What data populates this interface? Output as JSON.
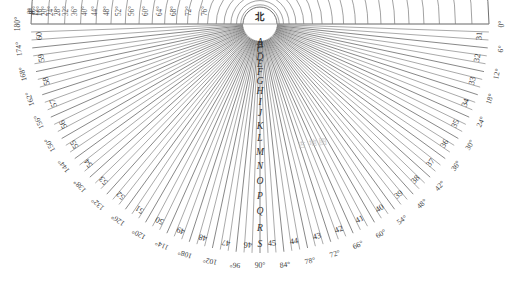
{
  "figure": {
    "kind": "polar-semicircle-star-chart",
    "north_label": "北",
    "watermark": "古 地 图",
    "degree_suffix": "°",
    "background": "#ffffff",
    "line_color": "#555555",
    "text_color": "#3a3a3a"
  },
  "geometry": {
    "center_x": 260,
    "center_y": 24,
    "inner_radius": 17,
    "outer_radius": 229,
    "start_angle_deg": 0,
    "end_angle_deg": 180,
    "radial_step_deg": 2,
    "top_label_step_deg": 4,
    "outer_label_step_deg": 6
  },
  "top_degrees_right": [
    "0°",
    "4°",
    "8°",
    "12°",
    "16°",
    "20°",
    "24°",
    "28°",
    "32°",
    "36°",
    "40°",
    "44°",
    "48°",
    "52°",
    "56°",
    "60°",
    "64°",
    "68°",
    "72°",
    "76°"
  ],
  "top_degrees_left": [
    "0°",
    "6°",
    "12°"
  ],
  "outer_degrees": [
    "0°",
    "6°",
    "12°",
    "18°",
    "24°",
    "30°",
    "36°",
    "42°",
    "48°",
    "54°",
    "60°",
    "66°",
    "72°",
    "78°",
    "84°",
    "90°",
    "96°",
    "102°",
    "108°",
    "114°",
    "120°",
    "126°",
    "132°",
    "138°",
    "144°",
    "150°",
    "156°",
    "162°",
    "168°",
    "174°",
    "180°"
  ],
  "outer_cell_numbers": [
    31,
    32,
    33,
    34,
    35,
    36,
    37,
    38,
    39,
    40,
    41,
    42,
    43,
    44,
    45,
    46,
    47,
    48,
    49,
    50,
    51,
    52,
    53,
    54,
    55,
    56,
    57,
    58,
    59,
    60
  ],
  "center_ring_letters": [
    "S",
    "R",
    "Q",
    "P",
    "O",
    "N",
    "M",
    "L",
    "K",
    "J",
    "I",
    "H",
    "G",
    "F",
    "E",
    "D",
    "C",
    "B",
    "A"
  ],
  "bottom_center_row": {
    "left_number": "45",
    "letter": "A",
    "right_number": "46"
  }
}
